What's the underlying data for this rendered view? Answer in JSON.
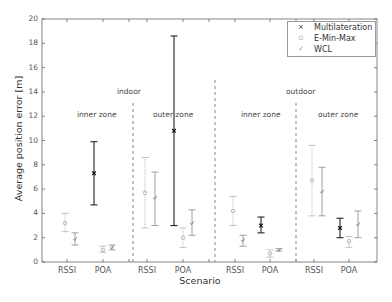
{
  "chart_data": {
    "type": "errorbar",
    "title": "",
    "xlabel": "Scenario",
    "ylabel": "Average position error [m]",
    "ylim": [
      0,
      20
    ],
    "yticks": [
      0,
      2,
      4,
      6,
      8,
      10,
      12,
      14,
      16,
      18,
      20
    ],
    "grid": false,
    "legend_position": "upper right",
    "legend": [
      {
        "name": "Multilateration",
        "marker": "x",
        "color": "#222222"
      },
      {
        "name": "E-Min-Max",
        "marker": "o",
        "color": "#999999"
      },
      {
        "name": "WCL",
        "marker": "✓",
        "color": "#777777"
      }
    ],
    "groups": [
      {
        "environment": "indoor",
        "zone": "inner zone",
        "categories": [
          "RSSI",
          "POA"
        ]
      },
      {
        "environment": "indoor",
        "zone": "outer zone",
        "categories": [
          "RSSI",
          "POA"
        ]
      },
      {
        "environment": "outdoor",
        "zone": "inner zone",
        "categories": [
          "RSSI",
          "POA"
        ]
      },
      {
        "environment": "outdoor",
        "zone": "outer zone",
        "categories": [
          "RSSI",
          "POA"
        ]
      }
    ],
    "series": [
      {
        "name": "Multilateration",
        "points": [
          {
            "group": "indoor/inner",
            "category": "POA",
            "mean": 7.3,
            "low": 4.7,
            "high": 9.9
          },
          {
            "group": "indoor/outer",
            "category": "POA",
            "mean": 10.8,
            "low": 3.0,
            "high": 18.6
          },
          {
            "group": "outdoor/inner",
            "category": "POA",
            "mean": 3.0,
            "low": 2.4,
            "high": 3.7
          },
          {
            "group": "outdoor/outer",
            "category": "POA",
            "mean": 2.8,
            "low": 2.0,
            "high": 3.6
          }
        ]
      },
      {
        "name": "E-Min-Max",
        "points": [
          {
            "group": "indoor/inner",
            "category": "RSSI",
            "mean": 3.2,
            "low": 2.5,
            "high": 4.0
          },
          {
            "group": "indoor/inner",
            "category": "POA",
            "mean": 1.0,
            "low": 0.8,
            "high": 1.3
          },
          {
            "group": "indoor/outer",
            "category": "RSSI",
            "mean": 5.7,
            "low": 2.8,
            "high": 8.6
          },
          {
            "group": "indoor/outer",
            "category": "POA",
            "mean": 2.0,
            "low": 1.2,
            "high": 2.8
          },
          {
            "group": "outdoor/inner",
            "category": "RSSI",
            "mean": 4.2,
            "low": 3.0,
            "high": 5.4
          },
          {
            "group": "outdoor/inner",
            "category": "POA",
            "mean": 0.7,
            "low": 0.4,
            "high": 1.0
          },
          {
            "group": "outdoor/outer",
            "category": "RSSI",
            "mean": 6.7,
            "low": 3.8,
            "high": 9.6
          },
          {
            "group": "outdoor/outer",
            "category": "POA",
            "mean": 1.7,
            "low": 1.2,
            "high": 2.1
          }
        ]
      },
      {
        "name": "WCL",
        "points": [
          {
            "group": "indoor/inner",
            "category": "RSSI",
            "mean": 1.9,
            "low": 1.4,
            "high": 2.4
          },
          {
            "group": "indoor/inner",
            "category": "POA",
            "mean": 1.2,
            "low": 1.0,
            "high": 1.4
          },
          {
            "group": "indoor/outer",
            "category": "RSSI",
            "mean": 5.3,
            "low": 3.0,
            "high": 7.4
          },
          {
            "group": "indoor/outer",
            "category": "POA",
            "mean": 3.2,
            "low": 2.2,
            "high": 4.3
          },
          {
            "group": "outdoor/inner",
            "category": "RSSI",
            "mean": 1.8,
            "low": 1.3,
            "high": 2.2
          },
          {
            "group": "outdoor/inner",
            "category": "POA",
            "mean": 1.0,
            "low": 0.9,
            "high": 1.1
          },
          {
            "group": "outdoor/outer",
            "category": "RSSI",
            "mean": 5.8,
            "low": 3.8,
            "high": 7.8
          },
          {
            "group": "outdoor/outer",
            "category": "POA",
            "mean": 3.1,
            "low": 2.0,
            "high": 4.2
          }
        ]
      }
    ],
    "annotations": [
      {
        "text": "indoor",
        "x": 0.255,
        "y": 14.2
      },
      {
        "text": "outdoor",
        "x": 0.77,
        "y": 14.2
      },
      {
        "text": "inner zone",
        "x": 0.13,
        "y": 12.2
      },
      {
        "text": "outer zone",
        "x": 0.36,
        "y": 12.2
      },
      {
        "text": "inner zone",
        "x": 0.63,
        "y": 12.2
      },
      {
        "text": "outer zone",
        "x": 0.87,
        "y": 12.2
      }
    ]
  },
  "labels": {
    "xlabel": "Scenario",
    "ylabel": "Average position error [m]",
    "legend": [
      "Multilateration",
      "E-Min-Max",
      "WCL"
    ],
    "legend_marks": [
      "×",
      "⊙",
      "✓"
    ],
    "env": [
      "indoor",
      "outdoor"
    ],
    "zones": [
      "inner zone",
      "outer zone",
      "inner zone",
      "outer zone"
    ],
    "xticks": [
      "RSSI",
      "POA",
      "RSSI",
      "POA",
      "RSSI",
      "POA",
      "RSSI",
      "POA"
    ],
    "yticks": [
      "0",
      "2",
      "4",
      "6",
      "8",
      "10",
      "12",
      "14",
      "16",
      "18",
      "20"
    ]
  }
}
